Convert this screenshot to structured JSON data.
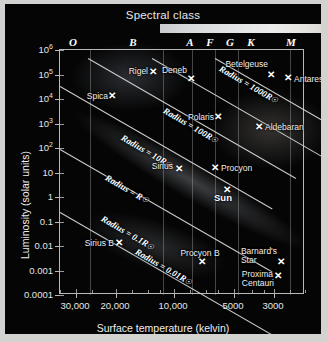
{
  "figure": {
    "type": "Hertzsprung-Russell diagram",
    "spectral_title": "Spectral class",
    "xlabel": "Surface temperature (kelvin)",
    "ylabel": "Luminosity (solar units)"
  },
  "spectral_classes": [
    {
      "label": "O",
      "x": 68
    },
    {
      "label": "B",
      "x": 128
    },
    {
      "label": "A",
      "x": 185
    },
    {
      "label": "F",
      "x": 205
    },
    {
      "label": "G",
      "x": 225
    },
    {
      "label": "K",
      "x": 246
    },
    {
      "label": "M",
      "x": 286
    }
  ],
  "yaxis": {
    "ticks": [
      {
        "label": "10",
        "sup": "6",
        "y": 0
      },
      {
        "label": "10",
        "sup": "5",
        "y": 24.5
      },
      {
        "label": "10",
        "sup": "4",
        "y": 49
      },
      {
        "label": "10",
        "sup": "3",
        "y": 73.5
      },
      {
        "label": "10",
        "sup": "2",
        "y": 98
      },
      {
        "label": "10",
        "sup": "",
        "y": 122.5
      },
      {
        "label": "1",
        "sup": "",
        "y": 147
      },
      {
        "label": "0.1",
        "sup": "",
        "y": 171.5
      },
      {
        "label": "0.01",
        "sup": "",
        "y": 196
      },
      {
        "label": "0.001",
        "sup": "",
        "y": 220.5
      },
      {
        "label": "0.0001",
        "sup": "",
        "y": 245
      }
    ]
  },
  "xaxis": {
    "ticks": [
      {
        "label": "30,000",
        "x": 16
      },
      {
        "label": "20,000",
        "x": 56
      },
      {
        "label": "10,000",
        "x": 114
      },
      {
        "label": "5000",
        "x": 174
      },
      {
        "label": "3000",
        "x": 214
      }
    ],
    "minor": [
      0,
      32,
      72,
      88,
      100,
      130,
      146,
      158,
      192,
      204,
      230,
      245
    ]
  },
  "class_dividers": [
    30,
    103,
    132,
    155,
    178,
    230
  ],
  "radius_lines": [
    {
      "label": "Radius = ",
      "sub": "1000R",
      "symbol": "☉",
      "x": 155,
      "y": 8,
      "len": 150,
      "angle": 30,
      "lx": 160,
      "ly": 13
    },
    {
      "label": "Radius = ",
      "sub": "100R",
      "symbol": "☉",
      "x": 92,
      "y": 8,
      "len": 215,
      "angle": 30,
      "lx": 104,
      "ly": 55
    },
    {
      "label": "Radius = ",
      "sub": "10R",
      "symbol": "☉",
      "x": 28,
      "y": 8,
      "len": 240,
      "angle": 30,
      "lx": 62,
      "ly": 82
    },
    {
      "label": "Radius = ",
      "sub": "R",
      "symbol": "☉",
      "x": 0,
      "y": 36,
      "len": 245,
      "angle": 30,
      "lx": 46,
      "ly": 122
    },
    {
      "label": "Radius = ",
      "sub": "0.1R",
      "symbol": "☉",
      "x": 0,
      "y": 99,
      "len": 245,
      "angle": 30,
      "lx": 42,
      "ly": 163
    },
    {
      "label": "Radius = ",
      "sub": "0.01R",
      "symbol": "☉",
      "x": 0,
      "y": 162,
      "len": 245,
      "angle": 30,
      "lx": 76,
      "ly": 196
    }
  ],
  "stars": [
    {
      "name": "Betelgeuse",
      "mx": 211,
      "my": 25,
      "lx": 208,
      "ly": 14,
      "align": "r"
    },
    {
      "name": "Antares",
      "mx": 228,
      "my": 28,
      "lx": 234,
      "ly": 29,
      "align": "l"
    },
    {
      "name": "Rigel",
      "mx": 93,
      "my": 22,
      "lx": 88,
      "ly": 21,
      "align": "r"
    },
    {
      "name": "Deneb",
      "mx": 131,
      "my": 29,
      "lx": 127,
      "ly": 20,
      "align": "r"
    },
    {
      "name": "Spica",
      "mx": 52,
      "my": 46,
      "lx": 48,
      "ly": 46,
      "align": "r"
    },
    {
      "name": "Polaris",
      "mx": 158,
      "my": 67,
      "lx": 154,
      "ly": 67,
      "align": "r"
    },
    {
      "name": "Aldebaran",
      "mx": 199,
      "my": 77,
      "lx": 205,
      "ly": 77,
      "align": "l"
    },
    {
      "name": "Sirius",
      "mx": 119,
      "my": 119,
      "lx": 113,
      "ly": 116,
      "align": "r"
    },
    {
      "name": "Procyon",
      "mx": 155,
      "my": 118,
      "lx": 161,
      "ly": 118,
      "align": "l"
    },
    {
      "name": "Sun",
      "mx": 167,
      "my": 140,
      "lx": 163,
      "ly": 148,
      "align": "c",
      "bold": true
    },
    {
      "name": "Sirius B",
      "mx": 59,
      "my": 193,
      "lx": 54,
      "ly": 193,
      "align": "r"
    },
    {
      "name": "Procyon B",
      "mx": 142,
      "my": 212,
      "lx": 140,
      "ly": 203,
      "align": "c"
    },
    {
      "name": "Barnard's\nStar",
      "mx": 221,
      "my": 212,
      "lx": 217,
      "ly": 206,
      "align": "r"
    },
    {
      "name": "Proxima\nCentauri",
      "mx": 218,
      "my": 226,
      "lx": 214,
      "ly": 229,
      "align": "r"
    }
  ],
  "colors": {
    "background": "#050505",
    "border": "#d2d2d0",
    "axis": "#b9b9b9",
    "text": "#ededed",
    "line": "#d8d8d8"
  }
}
